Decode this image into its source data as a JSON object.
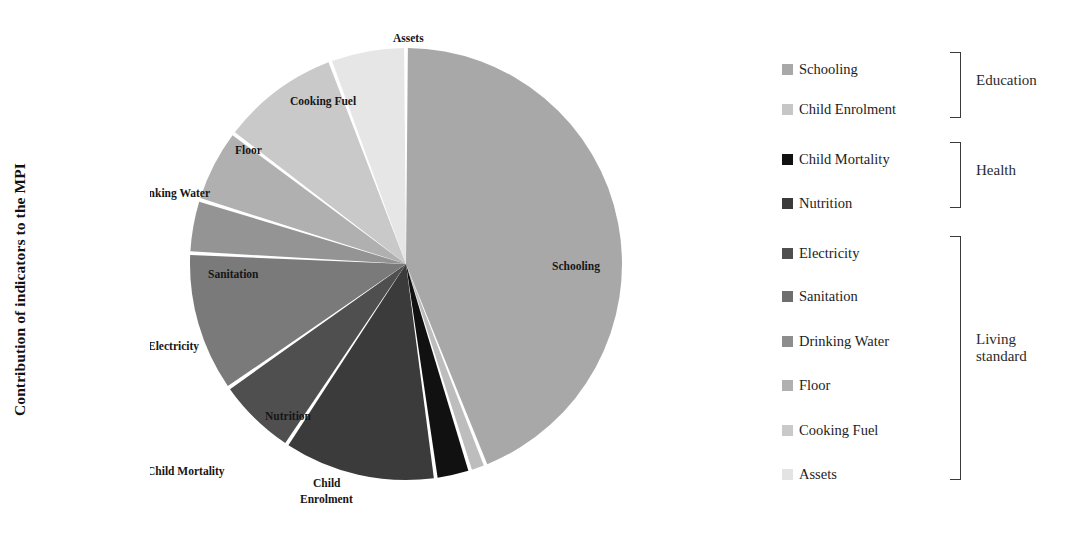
{
  "axis": {
    "title": "Contribution of indicators to the MPI"
  },
  "chart_data": {
    "type": "pie",
    "title": "",
    "xlabel": "",
    "ylabel": "Contribution of indicators to the MPI",
    "legend_position": "right",
    "grid": false,
    "categories": [
      "Schooling",
      "Child Enrolment",
      "Child Mortality",
      "Nutrition",
      "Electricity",
      "Sanitation",
      "Drinking Water",
      "Floor",
      "Cooking Fuel",
      "Assets"
    ],
    "values": [
      44.0,
      1.2,
      2.6,
      11.5,
      6.0,
      10.5,
      4.0,
      5.5,
      9.0,
      5.7
    ],
    "colors": [
      "#a8a8a8",
      "#bdbdbd",
      "#111111",
      "#3b3b3b",
      "#4f4f4f",
      "#7a7a7a",
      "#949494",
      "#b0b0b0",
      "#c9c9c9",
      "#e6e6e6"
    ],
    "slice_labels": [
      "Schooling",
      "Child Enrolment",
      "Child Mortality",
      "Nutrition",
      "Electricity",
      "Sanitation",
      "Drinking Water",
      "Floor",
      "Cooking Fuel",
      "Assets"
    ]
  },
  "pie_labels": {
    "schooling": "Schooling",
    "child_enrolment_line1": "Child",
    "child_enrolment_line2": "Enrolment",
    "child_mortality": "Child Mortality",
    "nutrition": "Nutrition",
    "electricity": "Electricity",
    "sanitation": "Sanitation",
    "drinking_water": "Drinking Water",
    "floor": "Floor",
    "cooking_fuel": "Cooking Fuel",
    "assets": "Assets"
  },
  "legend": {
    "items": [
      {
        "label": "Schooling",
        "color": "#a8a8a8"
      },
      {
        "label": "Child Enrolment",
        "color": "#c6c6c6"
      },
      {
        "label": "Child Mortality",
        "color": "#111111"
      },
      {
        "label": "Nutrition",
        "color": "#3b3b3b"
      },
      {
        "label": "Electricity",
        "color": "#4f4f4f"
      },
      {
        "label": "Sanitation",
        "color": "#6e6e6e"
      },
      {
        "label": "Drinking Water",
        "color": "#8d8d8d"
      },
      {
        "label": "Floor",
        "color": "#b0b0b0"
      },
      {
        "label": "Cooking Fuel",
        "color": "#c9c9c9"
      },
      {
        "label": "Assets",
        "color": "#e3e3e3"
      }
    ],
    "groups": [
      {
        "label": "Education"
      },
      {
        "label": "Health"
      },
      {
        "label": "Living\nstandard"
      }
    ]
  }
}
